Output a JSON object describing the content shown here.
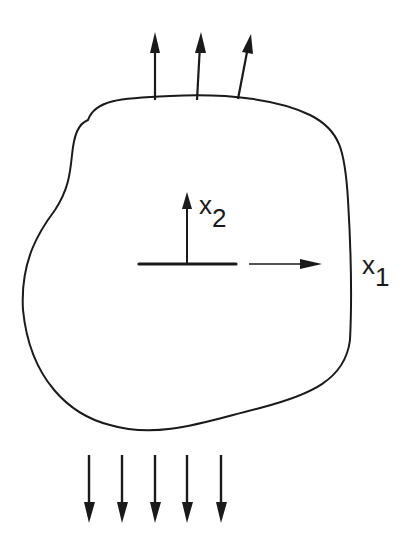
{
  "diagram": {
    "type": "body-with-crack",
    "labels": {
      "x1": {
        "base": "x",
        "sub": "1"
      },
      "x2": {
        "base": "x",
        "sub": "2"
      }
    },
    "top_arrows": {
      "count": 3,
      "direction": "up"
    },
    "bottom_arrows": {
      "count": 5,
      "direction": "down"
    },
    "colors": {
      "stroke": "#1a1a1a",
      "background": "#ffffff"
    }
  }
}
